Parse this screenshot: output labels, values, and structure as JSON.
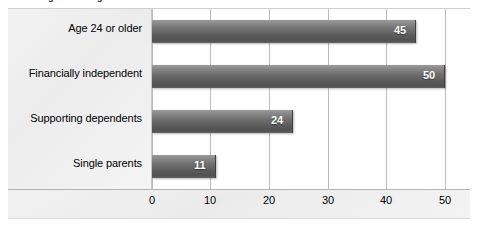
{
  "chart_data": {
    "type": "bar",
    "orientation": "horizontal",
    "title": "Percentage of undergraduates who are nontraditional students",
    "xlabel": "",
    "ylabel": "",
    "categories": [
      "Age 24 or older",
      "Financially independent",
      "Supporting dependents",
      "Single parents"
    ],
    "values": [
      45,
      50,
      24,
      11
    ],
    "value_labels": [
      "45",
      "50",
      "24",
      "11"
    ],
    "xlim": [
      0,
      50
    ],
    "xticks": [
      0,
      10,
      20,
      30,
      40,
      50
    ],
    "xtick_labels": [
      "0",
      "10",
      "20",
      "30",
      "40",
      "50"
    ],
    "grid": true,
    "grid_axis": "x",
    "legend": false,
    "bar_color": "#6e6e6e",
    "bar_color_light": "#9b9b9b",
    "bar_color_dark": "#515151",
    "label_panel_color": "#f0f0f0",
    "gridline_color": "#bdbdbd",
    "value_label_color": "#ffffff"
  }
}
